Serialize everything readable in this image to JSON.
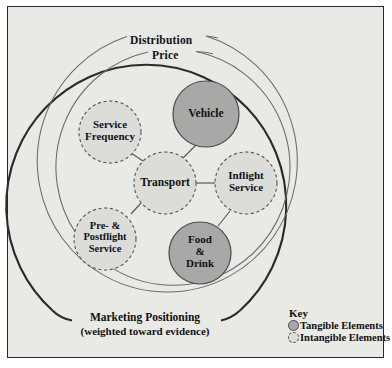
{
  "diagram": {
    "title_rings": {
      "outer_ring_label": "Distribution",
      "middle_ring_label": "Price",
      "outer_band_label_line1": "Marketing Positioning",
      "outer_band_label_line2": "(weighted toward evidence)"
    },
    "nodes": [
      {
        "id": "service-frequency",
        "label": "Service\nFrequency",
        "type": "intangible",
        "cx": 110,
        "cy": 132,
        "r": 31
      },
      {
        "id": "vehicle",
        "label": "Vehicle",
        "type": "tangible",
        "cx": 206,
        "cy": 114,
        "r": 33
      },
      {
        "id": "transport",
        "label": "Transport",
        "type": "intangible",
        "cx": 165,
        "cy": 183,
        "r": 31
      },
      {
        "id": "inflight-service",
        "label": "Inflight\nService",
        "type": "intangible",
        "cx": 246,
        "cy": 183,
        "r": 31
      },
      {
        "id": "pre-postflight",
        "label": "Pre- &\nPostflight\nService",
        "type": "intangible",
        "cx": 105,
        "cy": 239,
        "r": 31
      },
      {
        "id": "food-drink",
        "label": "Food\n&\nDrink",
        "type": "tangible",
        "cx": 200,
        "cy": 253,
        "r": 31
      }
    ],
    "links": [
      {
        "from": "transport",
        "to": "service-frequency"
      },
      {
        "from": "transport",
        "to": "vehicle"
      },
      {
        "from": "transport",
        "to": "inflight-service"
      },
      {
        "from": "transport",
        "to": "pre-postflight"
      },
      {
        "from": "inflight-service",
        "to": "food-drink"
      }
    ],
    "key": {
      "title": "Key",
      "items": [
        {
          "icon": "tangible-circle-icon",
          "label": "Tangible Elements"
        },
        {
          "icon": "intangible-circle-icon",
          "label": "Intangible Elements"
        }
      ]
    },
    "colors": {
      "background": "#e9e9e6",
      "frame_border": "#2a2a2a",
      "tangible_fill": "#a8a8a6",
      "intangible_fill": "#dcdcd9",
      "node_stroke": "#4a4a4a",
      "ring_stroke_outer": "#2b2b2b",
      "ring_stroke_inner": "#6e6e6e",
      "text": "#111111"
    }
  }
}
